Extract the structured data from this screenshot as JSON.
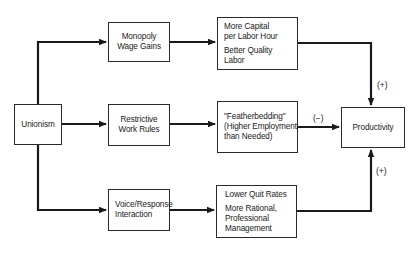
{
  "diagram": {
    "source": {
      "label": "Unionism"
    },
    "channels": [
      {
        "mechanism": [
          "Monopoly",
          "Wage Gains"
        ],
        "effects": [
          [
            "More Capital",
            "per Labor Hour"
          ],
          [
            "Better Quality",
            "Labor"
          ]
        ],
        "sign": "(+)"
      },
      {
        "mechanism": [
          "Restrictive",
          "Work Rules"
        ],
        "effects": [
          [
            "\"Featherbedding\"",
            "(Higher Employment",
            "than Needed)"
          ]
        ],
        "sign": "(−)"
      },
      {
        "mechanism": [
          "Voice/Response",
          "Interaction"
        ],
        "effects": [
          [
            "Lower Quit Rates"
          ],
          [
            "More Rational,",
            "Professional",
            "Management"
          ]
        ],
        "sign": "(+)"
      }
    ],
    "target": {
      "label": "Productivity"
    }
  }
}
